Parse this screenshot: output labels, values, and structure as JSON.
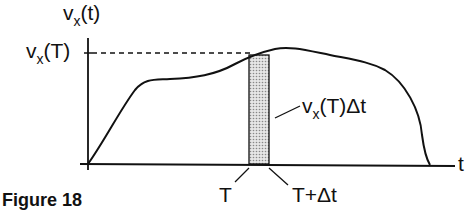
{
  "figure": {
    "caption": "Figure 18",
    "y_axis_label": {
      "main": "v",
      "sub": "x",
      "rest": "(t)"
    },
    "y_tick_label": {
      "main": "v",
      "sub": "x",
      "rest": "(T)"
    },
    "x_axis_label": "t",
    "x_tick_T": "T",
    "x_tick_T_dt": "T+Δt",
    "area_label": {
      "main": "v",
      "sub": "x",
      "rest": "(T)Δt"
    },
    "colors": {
      "line": "#111111",
      "shade": "#c8c8c8"
    }
  }
}
